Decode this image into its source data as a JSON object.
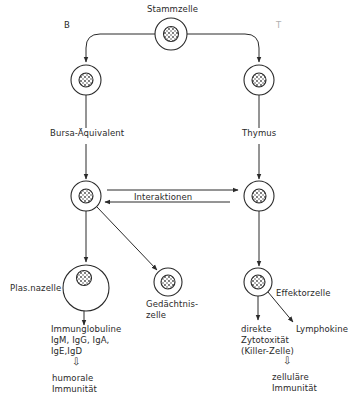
{
  "diagram": {
    "colors": {
      "stroke": "#2a2a2a",
      "nucleus": "#555555",
      "background": "#ffffff"
    },
    "branch_labels": {
      "left": "B",
      "right": "T"
    },
    "nodes": {
      "stem": {
        "label": "Stammzelle"
      },
      "b_precursor": {
        "label": ""
      },
      "t_precursor": {
        "label": ""
      },
      "b_lymphocyte": {
        "label": ""
      },
      "t_lymphocyte": {
        "label": ""
      },
      "plasma_cell": {
        "label": "Plas.nazelle"
      },
      "memory_cell": {
        "label": "Gedächtnis-\nzelle"
      },
      "effector_cell": {
        "label": "Effektorzelle"
      }
    },
    "organs": {
      "left": "Bursa-Äquivalent",
      "right": "Thymus"
    },
    "interaction_label": "Interaktionen",
    "outputs": {
      "immunoglobulins": "Immunglobuline\nIgM, IgG, IgA,\nIgE,IgD",
      "humoral": "humorale\nImmunität",
      "cytotoxicity": "direkte\nZytotoxität\n(Killer-Zelle)",
      "lymphokines": "Lymphokine",
      "cellular": "zelluläre\nImmunität"
    },
    "implies_symbol": "⇩"
  }
}
